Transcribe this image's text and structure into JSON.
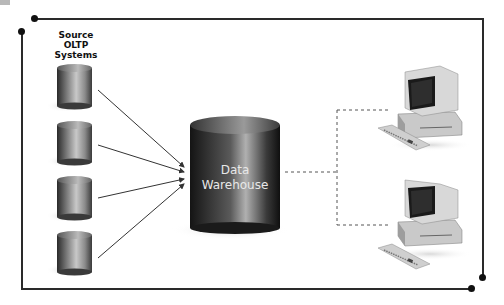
{
  "diagram": {
    "source_label": [
      "Source",
      "OLTP",
      "Systems"
    ],
    "warehouse_label": [
      "Data",
      "Warehouse"
    ],
    "source_systems": [
      {
        "name": "source-db-1"
      },
      {
        "name": "source-db-2"
      },
      {
        "name": "source-db-3"
      },
      {
        "name": "source-db-4"
      }
    ],
    "clients": [
      {
        "name": "client-workstation-1"
      },
      {
        "name": "client-workstation-2"
      }
    ],
    "colors": {
      "border": "#2a2a2a",
      "cylinder_dark": "#1a1a1a",
      "cylinder_light": "#bdbdbd",
      "arrow": "#333333",
      "dashed": "#555555"
    }
  }
}
